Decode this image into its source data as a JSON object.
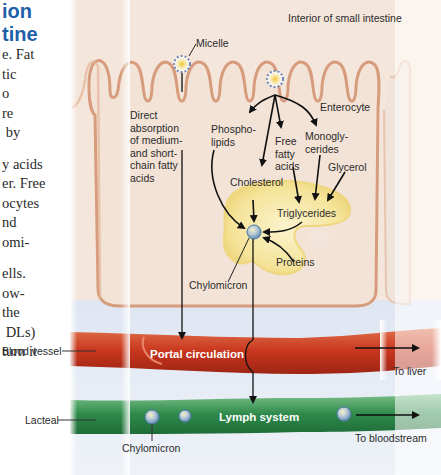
{
  "heading": {
    "line1": "ion",
    "line2": "tine"
  },
  "body_text": [
    "e. Fat",
    "tic",
    "o",
    "re",
    " by",
    "",
    "y acids",
    "er. Free",
    "ocytes",
    "nd",
    "omi-",
    "",
    "ells.",
    "ow-",
    "the",
    " DLs)",
    "turn it"
  ],
  "diagram": {
    "region_label": "Interior of small intestine",
    "micelle_label": "Micelle",
    "direct_absorption": "Direct\nabsorption\nof medium-\nand short-\nchain fatty\nacids",
    "enterocyte": "Enterocyte",
    "phospholipids": "Phospho-\nlipids",
    "free_fatty_acids": "Free\nfatty\nacids",
    "monoglycerides": "Monogly-\ncerides",
    "glycerol": "Glycerol",
    "cholesterol": "Cholesterol",
    "triglycerides": "Triglycerides",
    "proteins": "Proteins",
    "chylomicron_cell": "Chylomicron",
    "blood_vessel": "Blood vessel",
    "portal_circulation": "Portal circulation",
    "to_liver": "To liver",
    "lacteal": "Lacteal",
    "lymph_system": "Lymph system",
    "chylomicron_lymph": "Chylomicron",
    "to_bloodstream": "To bloodstream"
  },
  "colors": {
    "heading": "#1f5fa8",
    "cell_fill": "#f2dccb",
    "cell_outline": "#d49a78",
    "blood_vessel": "#c8402a",
    "lymph": "#3f9a5a",
    "fluid": "#c9d8ec",
    "golgi_yellow": "#f6e49a"
  }
}
